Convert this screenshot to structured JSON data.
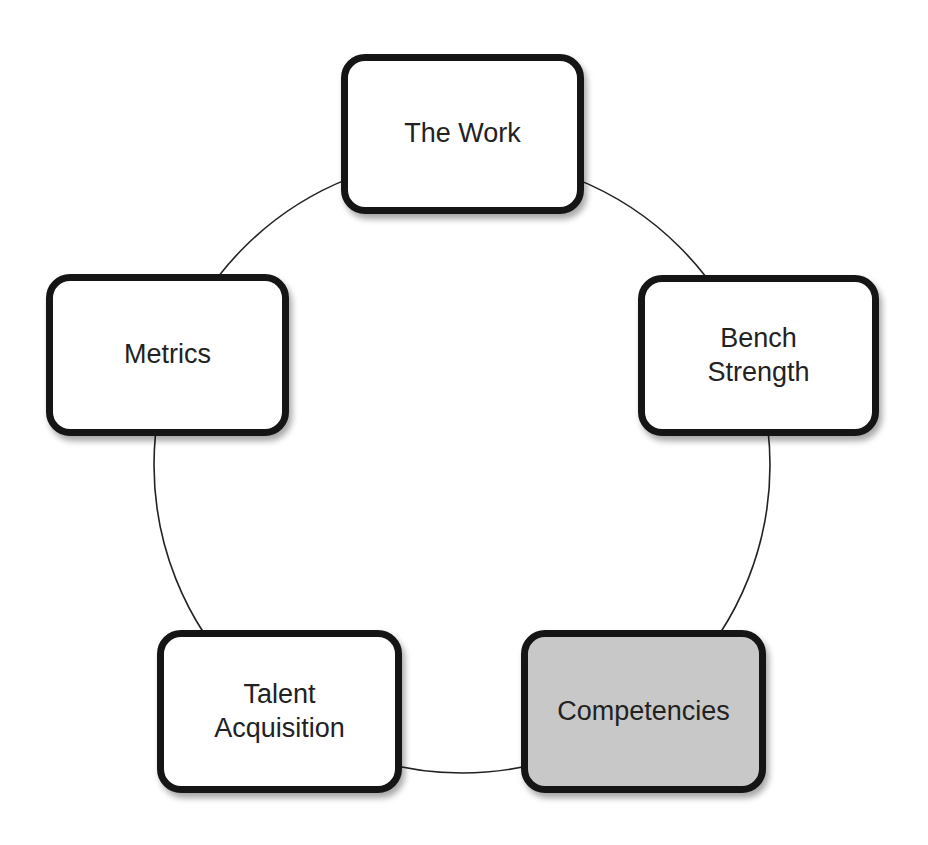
{
  "diagram": {
    "type": "cycle",
    "ring": {
      "cx": 462,
      "cy": 465,
      "r": 308,
      "color": "#222222"
    },
    "nodes": [
      {
        "id": "the-work",
        "label": "The Work",
        "highlighted": false,
        "x": 341,
        "y": 54,
        "w": 243,
        "h": 160
      },
      {
        "id": "bench-strength",
        "label": "Bench\nStrength",
        "highlighted": false,
        "x": 638,
        "y": 275,
        "w": 241,
        "h": 161
      },
      {
        "id": "competencies",
        "label": "Competencies",
        "highlighted": true,
        "x": 521,
        "y": 630,
        "w": 245,
        "h": 163
      },
      {
        "id": "talent-acquisition",
        "label": "Talent\nAcquisition",
        "highlighted": false,
        "x": 157,
        "y": 630,
        "w": 245,
        "h": 163
      },
      {
        "id": "metrics",
        "label": "Metrics",
        "highlighted": false,
        "x": 46,
        "y": 274,
        "w": 243,
        "h": 162
      }
    ],
    "colors": {
      "node_fill": "#ffffff",
      "highlight_fill": "#c8c8c8",
      "border": "#151515"
    }
  }
}
